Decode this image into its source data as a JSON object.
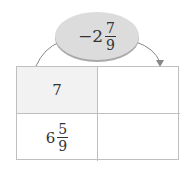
{
  "operator": {
    "sign": "−",
    "whole": "2",
    "numerator": "7",
    "denominator": "9"
  },
  "table": {
    "rows": [
      {
        "left": {
          "whole": "7"
        },
        "right": ""
      },
      {
        "left": {
          "whole": "6",
          "numerator": "5",
          "denominator": "9"
        },
        "right": ""
      }
    ]
  },
  "colors": {
    "oval": "#dcdcdc",
    "shaded_cell": "#f2f2f2",
    "border": "#bfbfbf"
  }
}
